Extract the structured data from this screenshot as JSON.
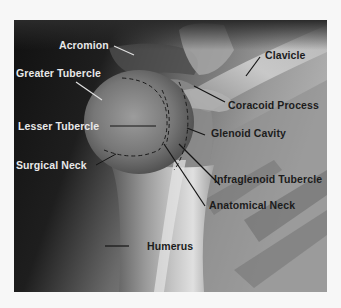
{
  "figure": {
    "colors": {
      "background": "#f7f7f7",
      "light_label": "#e8e8e8",
      "dark_label": "#1c1c1c",
      "leader_line_dark": "#151515",
      "leader_line_light": "#e0e0e0"
    }
  },
  "labels": {
    "acromion": "Acromion",
    "greater_tubercle": "Greater Tubercle",
    "lesser_tubercle": "Lesser Tubercle",
    "surgical_neck": "Surgical Neck",
    "clavicle": "Clavicle",
    "coracoid_process": "Coracoid Process",
    "glenoid_cavity": "Glenoid Cavity",
    "infraglenoid_tubercle": "Infraglenoid Tubercle",
    "anatomical_neck": "Anatomical Neck",
    "humerus": "Humerus"
  }
}
